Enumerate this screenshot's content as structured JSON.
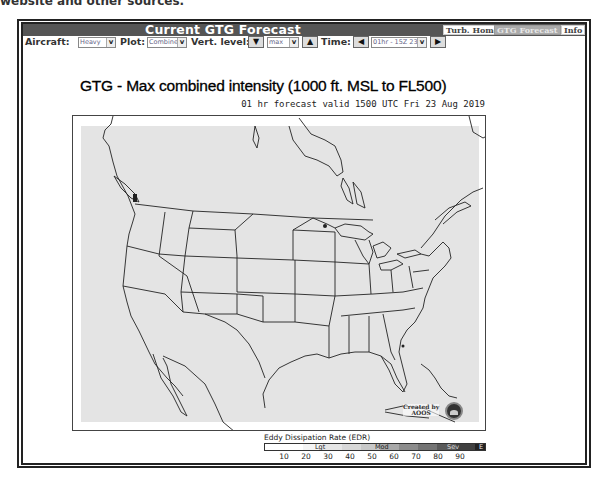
{
  "page": {
    "top_cut_text": "website and other sources.",
    "bottom_cut_text": "— — — — — — —"
  },
  "header": {
    "title": "Current GTG Forecast",
    "buttons": [
      {
        "label": "Turb. Home",
        "active": false
      },
      {
        "label": "GTG Forecast",
        "active": true
      },
      {
        "label": "Info",
        "active": false
      }
    ]
  },
  "toolbar": {
    "aircraft_label": "Aircraft:",
    "aircraft_value": "Heavy",
    "plot_label": "Plot:",
    "plot_value": "Combined",
    "vert_label": "Vert. level:",
    "vert_down": "▼",
    "vert_value": "max",
    "vert_up": "▲",
    "time_label": "Time:",
    "time_prev": "◀",
    "time_value": "01hr - 15Z 23 Aug",
    "time_next": "▶",
    "chevron": "⌄"
  },
  "chart": {
    "title": "GTG - Max combined intensity (1000 ft. MSL to FL500)",
    "subtitle": "01 hr forecast valid 1500 UTC Fri 23 Aug 2019",
    "credit_line1": "Created by",
    "credit_line2": "AOOS",
    "logo": "noaa-logo"
  },
  "legend": {
    "title": "Eddy Dissipation Rate (EDR)",
    "categories": [
      {
        "label": "Lgt",
        "pos": 50
      },
      {
        "label": "Mod",
        "pos": 110
      },
      {
        "label": "Sev",
        "pos": 182
      },
      {
        "label": "E",
        "pos": 216
      }
    ],
    "ticks": [
      "10",
      "20",
      "30",
      "40",
      "50",
      "60",
      "70",
      "80",
      "90"
    ],
    "colors": [
      "#ffffff",
      "#f0f0f0",
      "#e0e0e0",
      "#cfcfcf",
      "#bdbdbd",
      "#a8a8a8",
      "#8f8f8f",
      "#777777",
      "#5f5f5f",
      "#484848",
      "#2e2e2e"
    ]
  }
}
